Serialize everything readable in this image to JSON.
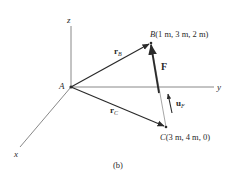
{
  "figure": {
    "caption": "(b)",
    "origin_label": "A",
    "axes": {
      "x": "x",
      "y": "y",
      "z": "z"
    },
    "points": {
      "B": {
        "letter": "B",
        "coords": "(1 m, 3 m, 2 m)"
      },
      "C": {
        "letter": "C",
        "coords": "(3 m, 4 m, 0)"
      }
    },
    "vectors": {
      "rB": {
        "main": "r",
        "sub": "B"
      },
      "rC": {
        "main": "r",
        "sub": "C"
      },
      "F": {
        "main": "F"
      },
      "uF": {
        "main": "u",
        "sub": "F"
      }
    },
    "colors": {
      "ink": "#2a2a2a",
      "axis": "#6a6a6a",
      "background": "#ffffff"
    }
  }
}
